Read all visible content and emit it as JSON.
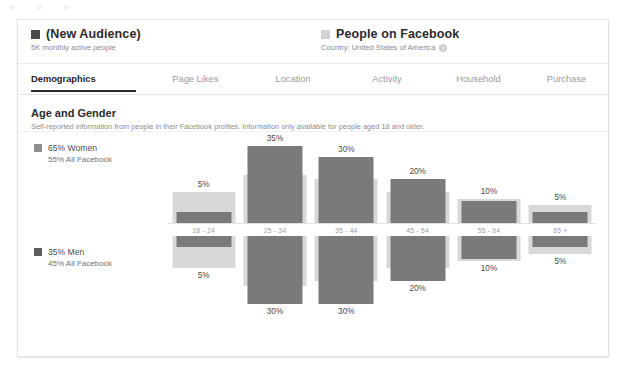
{
  "window": {
    "dots": [
      "dot-1",
      "dot-2",
      "dot-3"
    ]
  },
  "header": {
    "audience": {
      "swatch_color": "#4a4a4a",
      "title": "(New Audience)",
      "subtitle": "5K monthly active people"
    },
    "benchmark": {
      "swatch_color": "#d2d2d2",
      "title": "People on Facebook",
      "subtitle": "Country: United States of America",
      "info_glyph": "i"
    }
  },
  "tabs": [
    {
      "label": "Demographics",
      "active": true
    },
    {
      "label": "Page Likes",
      "active": false
    },
    {
      "label": "Location",
      "active": false
    },
    {
      "label": "Activity",
      "active": false
    },
    {
      "label": "Household",
      "active": false
    },
    {
      "label": "Purchase",
      "active": false
    }
  ],
  "section": {
    "title": "Age and Gender",
    "subtitle": "Self-reported information from people in their Facebook profiles. Information only available for people aged 18 and older."
  },
  "legend": {
    "women": {
      "swatch_color": "#8d8d8d",
      "main": "65% Women",
      "sub": "55% All Facebook"
    },
    "men": {
      "swatch_color": "#5e5e5e",
      "main": "35% Men",
      "sub": "45% All Facebook"
    }
  },
  "chart_data": {
    "type": "bar",
    "title": "Age and Gender",
    "xlabel": "",
    "ylabel": "",
    "grid": false,
    "legend_position": "left",
    "categories": [
      "18 - 24",
      "25 - 34",
      "35 - 44",
      "45 - 54",
      "55 - 64",
      "65 +"
    ],
    "series": [
      {
        "name": "65% Women",
        "direction": "up",
        "color": "#7a7a7a",
        "values": [
          5,
          35,
          30,
          20,
          10,
          5
        ],
        "labels": [
          "5%",
          "35%",
          "30%",
          "20%",
          "10%",
          "5%"
        ]
      },
      {
        "name": "35% Men",
        "direction": "down",
        "color": "#7a7a7a",
        "values": [
          5,
          30,
          30,
          20,
          10,
          5
        ],
        "labels": [
          "5%",
          "30%",
          "30%",
          "20%",
          "10%",
          "5%"
        ]
      },
      {
        "name": "All Facebook (women benchmark)",
        "direction": "up",
        "color": "#d8d8d8",
        "values": [
          14,
          22,
          20,
          14,
          11,
          8
        ]
      },
      {
        "name": "All Facebook (men benchmark)",
        "direction": "down",
        "color": "#d8d8d8",
        "values": [
          14,
          22,
          20,
          14,
          11,
          8
        ]
      }
    ],
    "ylim": [
      0,
      40
    ]
  }
}
